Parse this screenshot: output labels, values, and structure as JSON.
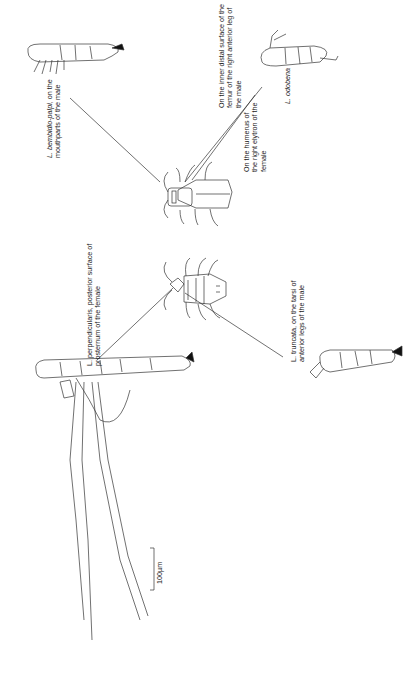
{
  "figure": {
    "scale_bar": "100µm",
    "labels": [
      {
        "id": "bembidio",
        "species": "L. bembidio-palpi",
        "lines": [
          "L. bembidio-palpi, on the",
          "mouthparts of the male"
        ]
      },
      {
        "id": "inner-distal",
        "lines": [
          "On the inner distal surface of the",
          "femur of the right anterior leg of",
          "the male"
        ]
      },
      {
        "id": "humerus",
        "lines": [
          "On the humerus of",
          "the right elytron of the",
          "female"
        ]
      },
      {
        "id": "odobena",
        "species": "L. odobena",
        "lines": [
          "L. odobena"
        ]
      },
      {
        "id": "perpendicularis",
        "species": "L. perpendicularis",
        "lines": [
          "L. perpendicularis, posterior surface of",
          "prosternum of the female"
        ]
      },
      {
        "id": "truncata",
        "species": "L. truncata",
        "lines": [
          "L. truncata, on the tarsi of",
          "anterior legs of the male"
        ]
      }
    ]
  }
}
